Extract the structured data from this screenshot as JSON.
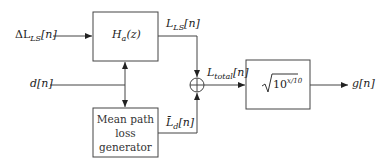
{
  "diagram": {
    "type": "block-diagram",
    "inputs": {
      "delta_l": "ΔL",
      "delta_l_sub": "LS",
      "delta_l_idx": "[n]",
      "d": "d",
      "d_idx": "[n]"
    },
    "blocks": {
      "filter": {
        "label": "H",
        "sub": "a",
        "arg": "(z)"
      },
      "mean_path": {
        "line1": "Mean path",
        "line2": "loss",
        "line3": "generator"
      },
      "sqrt": {
        "label": "10",
        "exp": "x/10"
      }
    },
    "signals": {
      "l_ls": "L",
      "l_ls_sub": "LS",
      "l_ls_idx": "[n]",
      "l_d": "L̄",
      "l_d_sub": "d",
      "l_d_idx": "[n]",
      "l_total": "L",
      "l_total_sub": "total",
      "l_total_idx": "[n]"
    },
    "output": {
      "g": "g",
      "g_idx": "[n]"
    },
    "summer": "⊕"
  }
}
